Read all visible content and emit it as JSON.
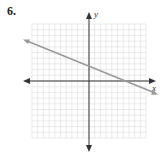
{
  "problem": {
    "number": "6."
  },
  "chart_data": {
    "type": "line",
    "title": "",
    "xlabel": "x",
    "ylabel": "y",
    "xlim": [
      -10,
      10
    ],
    "ylim": [
      -10,
      10
    ],
    "grid": true,
    "grid_step": 1,
    "series": [
      {
        "name": "line",
        "equation": "y = -2/5 x + 2.5",
        "x": [
          -11,
          0,
          6.25,
          12
        ],
        "y": [
          6.9,
          2.5,
          0,
          -2.3
        ]
      }
    ]
  },
  "colors": {
    "grid": "#d9d9d9",
    "axis": "#333333",
    "line": "#9a9a9a"
  }
}
